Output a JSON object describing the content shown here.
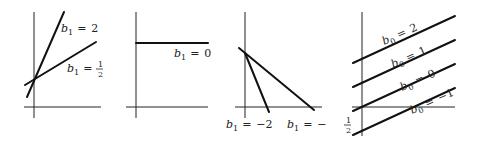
{
  "panels": [
    {
      "id": "panel-1",
      "description": "Lines through common intercept with positive slopes",
      "lines": [
        {
          "label": "b1 = 2",
          "var": "b",
          "sub": "1",
          "value": "2"
        },
        {
          "label": "b1 = 1/2",
          "var": "b",
          "sub": "1",
          "num": "1",
          "den": "2"
        }
      ]
    },
    {
      "id": "panel-2",
      "description": "Horizontal line, zero slope",
      "lines": [
        {
          "label": "b1 = 0",
          "var": "b",
          "sub": "1",
          "value": "0"
        }
      ]
    },
    {
      "id": "panel-3",
      "description": "Lines through common intercept with negative slopes",
      "lines": [
        {
          "label": "b1 = -2",
          "var": "b",
          "sub": "1",
          "value": "−2"
        },
        {
          "label": "b1 = -1/2",
          "var": "b",
          "sub": "1",
          "sign": "−",
          "num": "1",
          "den": "2"
        }
      ]
    },
    {
      "id": "panel-4",
      "description": "Parallel lines with different intercepts",
      "lines": [
        {
          "label": "b0 = 2",
          "var": "b",
          "sub": "0",
          "value": "2"
        },
        {
          "label": "b0 = 1",
          "var": "b",
          "sub": "0",
          "value": "1"
        },
        {
          "label": "b0 = 0",
          "var": "b",
          "sub": "0",
          "value": "0"
        },
        {
          "label": "b0 = -1",
          "var": "b",
          "sub": "0",
          "value": "−1"
        }
      ]
    }
  ],
  "equals": "="
}
